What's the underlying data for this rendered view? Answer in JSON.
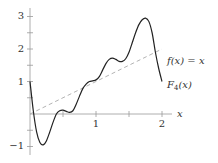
{
  "chart_data": {
    "type": "line",
    "title": "",
    "xlabel": "x",
    "ylabel": "",
    "xlim": [
      0,
      2.1
    ],
    "ylim": [
      -1.1,
      3.2
    ],
    "grid": false,
    "x_ticks": [
      0.5,
      1,
      1.5,
      2
    ],
    "x_tick_labels": [
      "",
      "1",
      "",
      "2"
    ],
    "y_ticks": [
      -1,
      -0.5,
      0.5,
      1,
      1.5,
      2,
      2.5,
      3
    ],
    "y_tick_labels": [
      "−1",
      "",
      "",
      "1",
      "",
      "2",
      "",
      "3"
    ],
    "series": [
      {
        "name": "F_4(x)",
        "label": "F4(x)",
        "style": "solid",
        "color": "#222222",
        "x": [
          0,
          0.05,
          0.1,
          0.15,
          0.2,
          0.25,
          0.3,
          0.35,
          0.4,
          0.45,
          0.5,
          0.55,
          0.6,
          0.65,
          0.7,
          0.75,
          0.8,
          0.85,
          0.9,
          0.95,
          1.0,
          1.05,
          1.1,
          1.15,
          1.2,
          1.25,
          1.3,
          1.35,
          1.4,
          1.45,
          1.5,
          1.55,
          1.6,
          1.65,
          1.7,
          1.75,
          1.8,
          1.85,
          1.9,
          1.95,
          2.0
        ],
        "y": [
          1.0,
          0.1,
          -0.55,
          -0.88,
          -0.95,
          -0.82,
          -0.55,
          -0.25,
          0.0,
          0.1,
          0.12,
          0.08,
          0.05,
          0.1,
          0.3,
          0.55,
          0.78,
          0.92,
          1.0,
          1.02,
          1.05,
          1.15,
          1.35,
          1.55,
          1.68,
          1.72,
          1.68,
          1.62,
          1.62,
          1.7,
          1.9,
          2.2,
          2.5,
          2.75,
          2.9,
          2.95,
          2.85,
          2.5,
          1.9,
          1.4,
          1.0
        ]
      },
      {
        "name": "f(x) = x",
        "label": "f(x) = x",
        "style": "dashed",
        "color": "#aaaaaa",
        "x": [
          0,
          2
        ],
        "y": [
          0,
          2
        ]
      }
    ],
    "annotations": [
      {
        "text": "f(x) = x",
        "x": 2.05,
        "y": 2.0
      },
      {
        "text": "F4(x)",
        "x": 2.05,
        "y": 0.85
      }
    ]
  },
  "labels": {
    "x_axis": "x",
    "y3": "3",
    "y2": "2",
    "y1": "1",
    "yneg1": "−1",
    "x1": "1",
    "x2": "2",
    "identity": "f(x) = x",
    "f4_main": "F",
    "f4_sub": "4",
    "f4_arg": "(x)"
  }
}
